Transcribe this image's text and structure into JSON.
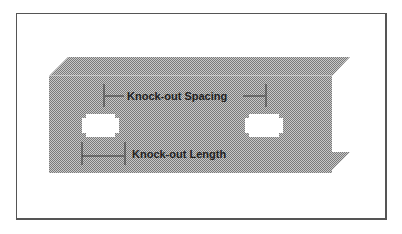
{
  "diagram": {
    "labels": {
      "spacing": "Knock-out Spacing",
      "length": "Knock-out Length"
    },
    "colors": {
      "metal": "#a9a9a9",
      "metal_dark": "#8c8c8c",
      "knockout": "#ffffff",
      "frame": "#555555",
      "text": "#222222"
    }
  }
}
